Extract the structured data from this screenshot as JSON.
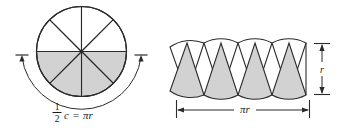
{
  "figure": {
    "name": "circle-sectors-rearranged-into-parallelogram",
    "background_color": "#ffffff",
    "stroke_color": "#2b2b2b",
    "shaded_fill": "#d2d2d2",
    "unshaded_fill": "#ffffff"
  },
  "left_diagram": {
    "name": "sectored-circle",
    "center_x": 81.5,
    "center_y": 51.5,
    "radius": 45,
    "sector_count": 8,
    "shaded_sectors": 4,
    "shaded_half": "bottom",
    "arrow_label": {
      "numerator": "1",
      "denominator": "2",
      "variable": "c",
      "equals": "=",
      "result": "πr",
      "full_text": "1/2 c = πr"
    }
  },
  "right_diagram": {
    "name": "sector-strip",
    "wedge_count": 8,
    "shaded_wedge_count": 4,
    "left_x": 176,
    "right_x": 310,
    "top_y": 43,
    "bottom_y": 95,
    "height_label": "r",
    "width_label": "πr"
  },
  "colors": {
    "stroke": "#2b2b2b",
    "fill_gray": "#d2d2d2",
    "fill_white": "#ffffff",
    "text": "#1a1a1a"
  }
}
